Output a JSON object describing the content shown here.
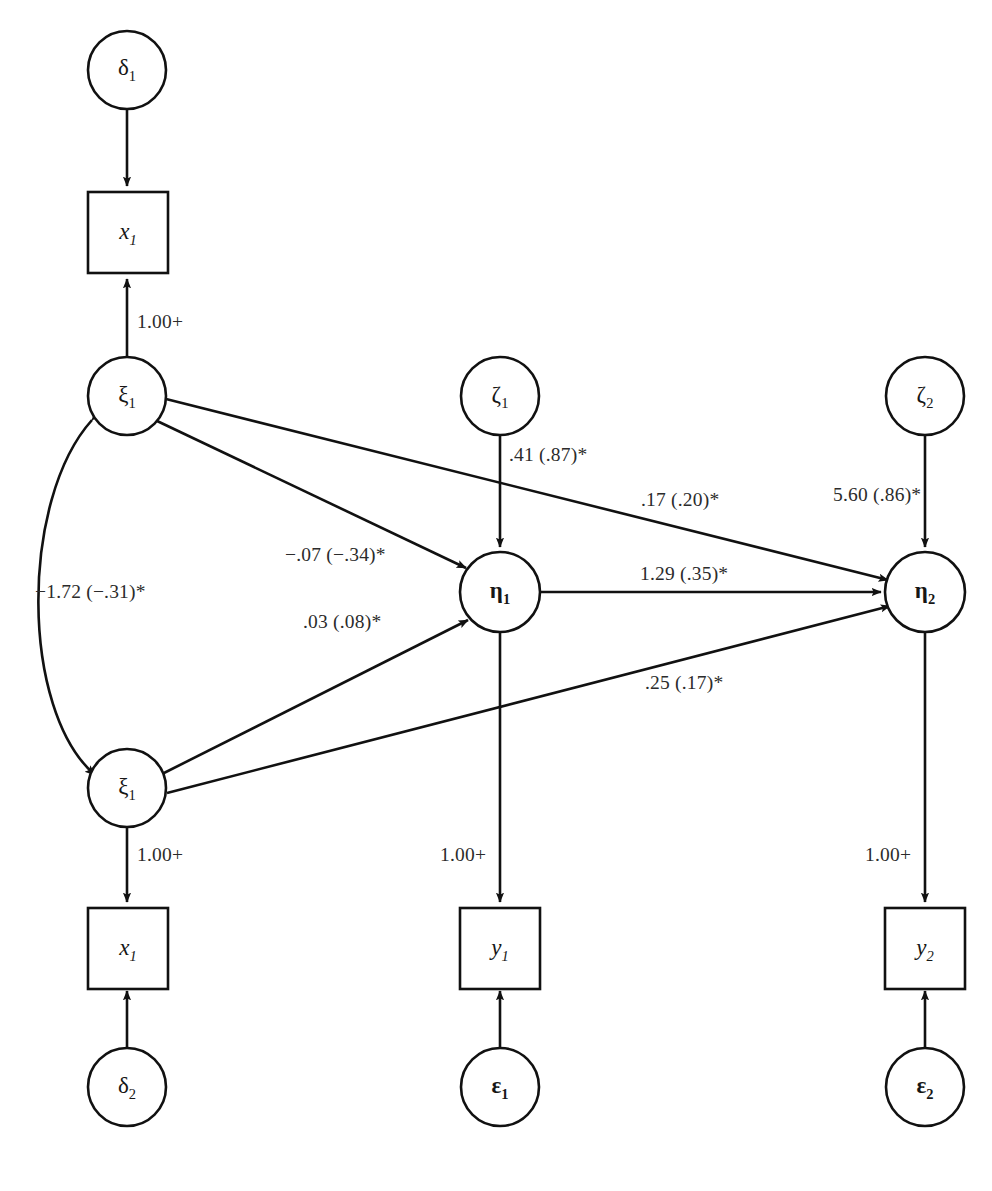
{
  "diagram": {
    "kind": "sem-path-diagram",
    "background_color": "#ffffff",
    "stroke_color": "#111111",
    "text_color": "#2b2b2b"
  },
  "nodes": {
    "delta1": {
      "label": "δ",
      "sub": "1",
      "type": "circle"
    },
    "delta2": {
      "label": "δ",
      "sub": "2",
      "type": "circle"
    },
    "zeta1": {
      "label": "ζ",
      "sub": "1",
      "type": "circle"
    },
    "zeta2": {
      "label": "ζ",
      "sub": "2",
      "type": "circle"
    },
    "epsilon1": {
      "label": "ε",
      "sub": "1",
      "type": "circle"
    },
    "epsilon2": {
      "label": "ε",
      "sub": "2",
      "type": "circle"
    },
    "xi_top": {
      "label": "ξ",
      "sub": "1",
      "type": "circle"
    },
    "xi_bottom": {
      "label": "ξ",
      "sub": "1",
      "type": "circle"
    },
    "eta1": {
      "label": "η",
      "sub": "1",
      "type": "circle"
    },
    "eta2": {
      "label": "η",
      "sub": "2",
      "type": "circle"
    },
    "x1_top": {
      "label": "x",
      "sub": "1",
      "type": "box"
    },
    "x1_bottom": {
      "label": "x",
      "sub": "1",
      "type": "box"
    },
    "y1": {
      "label": "y",
      "sub": "1",
      "type": "box"
    },
    "y2": {
      "label": "y",
      "sub": "2",
      "type": "box"
    }
  },
  "edge_labels": {
    "xi_top_to_x1": "1.00+",
    "xi_bottom_to_x1": "1.00+",
    "eta1_to_y1": "1.00+",
    "eta2_to_y2": "1.00+",
    "xi_covariance": "−1.72 (−.31)*",
    "zeta1_to_eta1": ".41 (.87)*",
    "zeta2_to_eta2": "5.60 (.86)*",
    "xi_top_to_eta1": "−.07 (−.34)*",
    "xi_bottom_to_eta1": ".03 (.08)*",
    "xi_top_to_eta2": ".17 (.20)*",
    "eta1_to_eta2": "1.29 (.35)*",
    "xi_bottom_to_eta2": ".25 (.17)*"
  }
}
